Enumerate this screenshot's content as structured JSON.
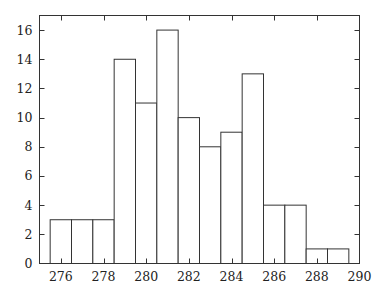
{
  "chart_data": {
    "type": "bar",
    "subtype": "histogram",
    "title": "",
    "xlabel": "",
    "ylabel": "",
    "xlim": [
      275,
      290
    ],
    "ylim": [
      0,
      17
    ],
    "grid": false,
    "legend": null,
    "bin_width": 1,
    "bins": [
      {
        "left": 275.5,
        "right": 276.5,
        "count": 3
      },
      {
        "left": 276.5,
        "right": 277.5,
        "count": 3
      },
      {
        "left": 277.5,
        "right": 278.5,
        "count": 3
      },
      {
        "left": 278.5,
        "right": 279.5,
        "count": 14
      },
      {
        "left": 279.5,
        "right": 280.5,
        "count": 11
      },
      {
        "left": 280.5,
        "right": 281.5,
        "count": 16
      },
      {
        "left": 281.5,
        "right": 282.5,
        "count": 10
      },
      {
        "left": 282.5,
        "right": 283.5,
        "count": 8
      },
      {
        "left": 283.5,
        "right": 284.5,
        "count": 9
      },
      {
        "left": 284.5,
        "right": 285.5,
        "count": 13
      },
      {
        "left": 285.5,
        "right": 286.5,
        "count": 4
      },
      {
        "left": 286.5,
        "right": 287.5,
        "count": 4
      },
      {
        "left": 287.5,
        "right": 288.5,
        "count": 1
      },
      {
        "left": 288.5,
        "right": 289.5,
        "count": 1
      }
    ],
    "categories": [
      276,
      277,
      278,
      279,
      280,
      281,
      282,
      283,
      284,
      285,
      286,
      287,
      288,
      289
    ],
    "values": [
      3,
      3,
      3,
      14,
      11,
      16,
      10,
      8,
      9,
      13,
      4,
      4,
      1,
      1
    ],
    "x_ticks": [
      276,
      278,
      280,
      282,
      284,
      286,
      288,
      290
    ],
    "y_ticks": [
      0,
      2,
      4,
      6,
      8,
      10,
      12,
      14,
      16
    ],
    "colors": {
      "bar_fill": "#ffffff",
      "bar_edge": "#333333",
      "axis": "#333333",
      "text": "#222222"
    }
  }
}
